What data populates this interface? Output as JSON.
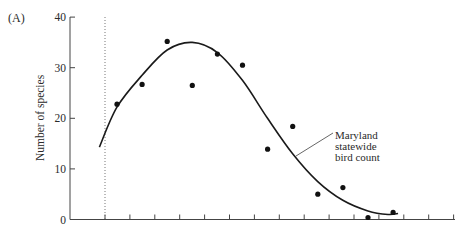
{
  "panel_label": "(A)",
  "chart_data": {
    "type": "scatter",
    "title": "",
    "panel": "(A)",
    "xlabel": "",
    "ylabel": "Number of species",
    "ylim": [
      0,
      40
    ],
    "yticks": [
      0,
      10,
      20,
      30,
      40
    ],
    "ytick_labels": [
      "0",
      "10",
      "20",
      "30",
      "40"
    ],
    "x_tick_count": 15,
    "x_tick_labels": [],
    "grid": false,
    "reference_line": {
      "style": "dotted",
      "orientation": "vertical",
      "at_tick_index": 0
    },
    "series": [
      {
        "name": "Observed species counts",
        "kind": "points",
        "x": [
          1,
          2,
          3,
          4,
          5,
          6,
          7,
          8,
          9,
          10,
          11,
          12
        ],
        "values": [
          22.8,
          26.7,
          35.2,
          26.5,
          32.7,
          30.5,
          13.9,
          18.4,
          5.0,
          6.3,
          0.4,
          1.4
        ]
      },
      {
        "name": "Maryland statewide bird count",
        "kind": "curve",
        "x": [
          -0.2,
          0.5,
          1.5,
          2.5,
          3.5,
          4.5,
          5.5,
          6.5,
          7.5,
          8.5,
          9.5,
          10.5,
          11.3,
          11.7
        ],
        "values": [
          14.3,
          22.2,
          28.5,
          33.5,
          35.0,
          33.0,
          27.5,
          20.0,
          13.0,
          7.5,
          3.8,
          1.7,
          1.0,
          1.2
        ]
      }
    ],
    "annotation": {
      "lines": [
        "Maryland",
        "statewide",
        "bird count"
      ],
      "points_to": "curve"
    }
  }
}
